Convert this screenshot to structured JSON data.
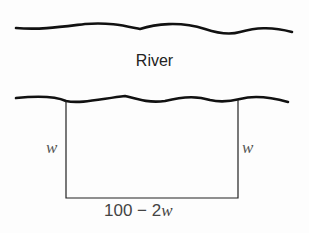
{
  "diagram": {
    "river_label": "River",
    "side_left_label": "w",
    "side_right_label": "w",
    "bottom_label_prefix": "100 − 2",
    "bottom_label_var": "w"
  }
}
